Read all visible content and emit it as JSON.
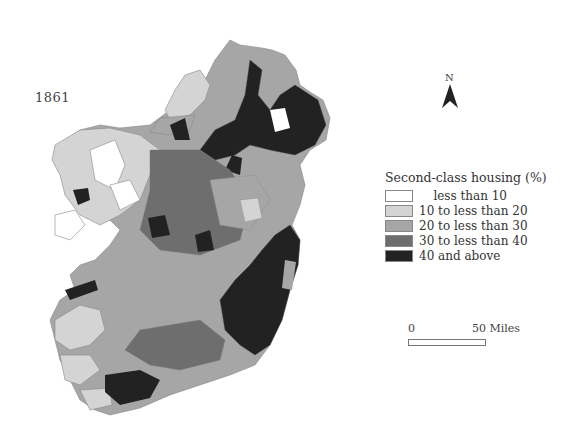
{
  "map": {
    "year": "1861",
    "subject": "Ireland",
    "north_label": "N",
    "legend": {
      "title": "Second-class housing (%)",
      "items": [
        {
          "label": "less than 10",
          "color": "#ffffff"
        },
        {
          "label": "10 to less than 20",
          "color": "#d4d4d4"
        },
        {
          "label": "20 to less than 30",
          "color": "#a6a6a6"
        },
        {
          "label": "30 to less than 40",
          "color": "#6e6e6e"
        },
        {
          "label": "40 and above",
          "color": "#222222"
        }
      ]
    },
    "scale": {
      "start": "0",
      "end": "50 Miles"
    }
  }
}
